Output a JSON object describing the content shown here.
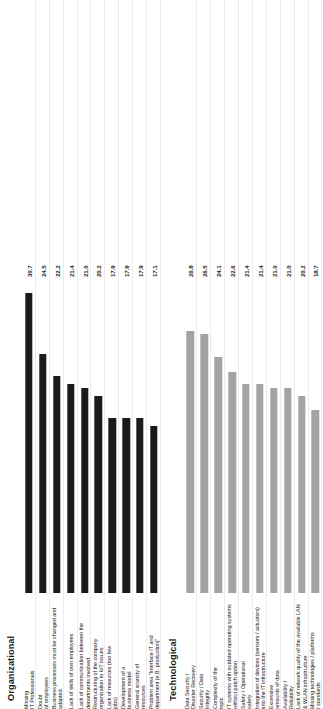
{
  "chart_data": {
    "type": "bar",
    "orientation": "horizontal",
    "title": "",
    "xlabel": "",
    "ylabel": "",
    "grid": false,
    "legend": "none",
    "xlim": [
      0,
      30.7
    ],
    "value_suffix": "",
    "panels": [
      {
        "id": "organizational",
        "title": "Organizational",
        "bar_color": "#1b1b1b",
        "categories": [
          "Missing\nIT Professionals",
          "Doubt\nof employees",
          "Business processes must be changed and\nadapted.",
          "Lack of skills of own employees",
          "Lack of communication between the\ndepartments involved",
          "Restructuring of the company\norganization to IoT issues",
          "Lack of resources (too few\njobs)",
          "Development of a\nbusiness model",
          "General scarcity of\nresources",
          "Problem area \"Interface IT and\ndepartment (e.B. production)\""
        ],
        "values": [
          30.7,
          24.5,
          22.2,
          21.4,
          21.0,
          20.2,
          17.9,
          17.9,
          17.9,
          17.1
        ],
        "value_labels": [
          "30.7",
          "24.5",
          "22.2",
          "21.4",
          "21.0",
          "20.2",
          "17.9",
          "17.9",
          "17.9",
          "17.1"
        ]
      },
      {
        "id": "technological",
        "title": "Technological",
        "bar_color": "#a3a3a3",
        "categories": [
          "Data Security /\nDisaster Recovery",
          "Security / Data\nIntegrity",
          "Complexity of the\ntopic",
          "IT systems with outdated operating systems\nwithout patch option",
          "Safety / Operational\nsafety",
          "Integration of devices (sensors / actuators)\ninto the IT infrastructure",
          "Excessive\namounts of data",
          "Availability /\nReliability",
          "Lack of network quality of the available LAN\n& WLAN infrastructure",
          "Missing technologies / platforms\n/ standards"
        ],
        "values": [
          26.8,
          26.5,
          24.1,
          22.6,
          21.4,
          21.4,
          21.0,
          21.0,
          20.2,
          18.7
        ],
        "value_labels": [
          "26.8",
          "26.5",
          "24.1",
          "22.6",
          "21.4",
          "21.4",
          "21.0",
          "21.0",
          "20.2",
          "18.7"
        ]
      }
    ]
  }
}
